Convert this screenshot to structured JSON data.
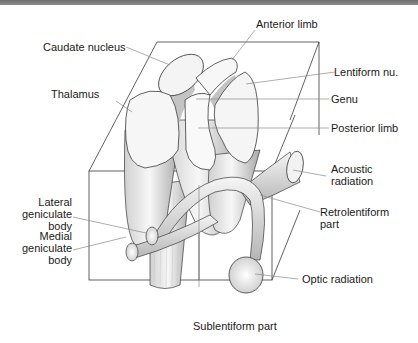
{
  "diagram": {
    "type": "anatomical-illustration",
    "labels": {
      "anterior_limb": "Anterior limb",
      "caudate_nucleus": "Caudate nucleus",
      "lentiform_nu": "Lentiform nu.",
      "thalamus": "Thalamus",
      "genu": "Genu",
      "posterior_limb": "Posterior limb",
      "acoustic_radiation_1": "Acoustic",
      "acoustic_radiation_2": "radiation",
      "lateral_gb_1": "Lateral",
      "lateral_gb_2": "geniculate",
      "lateral_gb_3": "body",
      "retrolentiform_1": "Retrolentiform",
      "retrolentiform_2": "part",
      "medial_gb_1": "Medial",
      "medial_gb_2": "geniculate",
      "medial_gb_3": "body",
      "optic_radiation": "Optic radiation",
      "sublentiform_part": "Sublentiform part"
    },
    "colors": {
      "top_bar": "#7a7a7a",
      "outline": "#3a3a3a",
      "leader_line": "#8a8a8a",
      "structure_fill": "#f2f2f2",
      "shade": "#bdbdbd"
    }
  }
}
